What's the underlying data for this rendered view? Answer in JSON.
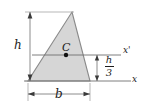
{
  "figure": {
    "colors": {
      "fill": "#d6d6d6",
      "outline": "#8a8a8a",
      "line": "#6f6f6f",
      "text": "#1c1c1c",
      "point": "#111111"
    }
  },
  "labels": {
    "height": "h",
    "base": "b",
    "centroid": "C",
    "axis_centroidal": "x'",
    "axis_base": "x",
    "fraction_numerator": "h",
    "fraction_denominator": "3"
  },
  "geometry": {
    "apex": {
      "x": 72,
      "y": 12
    },
    "bottom_left": {
      "x": 28,
      "y": 81
    },
    "bottom_right": {
      "x": 90,
      "y": 81
    },
    "centroid_point": {
      "x": 66,
      "y": 55
    },
    "axis_x_prime_y": 55,
    "axis_x_y": 81,
    "axis_x_prime_span": [
      32,
      121
    ],
    "axis_x_span": [
      24,
      131
    ],
    "height_dimension_x": 30,
    "height_dimension_span": [
      12,
      81
    ],
    "base_dimension_y": 94,
    "base_dimension_span": [
      28,
      90
    ],
    "h3_dimension_x": 97,
    "h3_dimension_span": [
      55,
      81
    ]
  }
}
